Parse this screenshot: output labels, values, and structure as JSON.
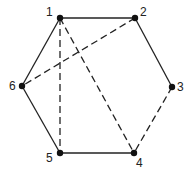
{
  "diagram": {
    "type": "graph",
    "nodes": [
      {
        "id": "1",
        "label": "1",
        "x": 60,
        "y": 18,
        "lx": 46,
        "ly": 6
      },
      {
        "id": "2",
        "label": "2",
        "x": 135,
        "y": 18,
        "lx": 140,
        "ly": 6
      },
      {
        "id": "3",
        "label": "3",
        "x": 172,
        "y": 87,
        "lx": 177,
        "ly": 81
      },
      {
        "id": "4",
        "label": "4",
        "x": 134,
        "y": 153,
        "lx": 136,
        "ly": 157
      },
      {
        "id": "5",
        "label": "5",
        "x": 60,
        "y": 153,
        "lx": 46,
        "ly": 152
      },
      {
        "id": "6",
        "label": "6",
        "x": 22,
        "y": 86,
        "lx": 9,
        "ly": 80
      }
    ],
    "edges": [
      {
        "from": "1",
        "to": "2",
        "style": "solid"
      },
      {
        "from": "2",
        "to": "3",
        "style": "solid"
      },
      {
        "from": "1",
        "to": "6",
        "style": "solid"
      },
      {
        "from": "6",
        "to": "5",
        "style": "solid"
      },
      {
        "from": "5",
        "to": "4",
        "style": "solid"
      },
      {
        "from": "3",
        "to": "4",
        "style": "dashed"
      },
      {
        "from": "1",
        "to": "5",
        "style": "dashed"
      },
      {
        "from": "1",
        "to": "4",
        "style": "dashed"
      },
      {
        "from": "2",
        "to": "6",
        "style": "dashed"
      }
    ]
  }
}
